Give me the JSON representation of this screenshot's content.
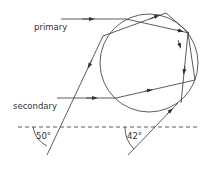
{
  "diagram": {
    "labels": {
      "primary": "primary",
      "secondary": "secondary",
      "angle_primary": "50°",
      "angle_secondary": "42°"
    },
    "colors": {
      "line": "#333333",
      "background": "#ffffff"
    },
    "drop": {
      "cx": 149,
      "cy": 63,
      "r": 49
    },
    "horizon": {
      "y": 127,
      "style": "dashed"
    }
  }
}
